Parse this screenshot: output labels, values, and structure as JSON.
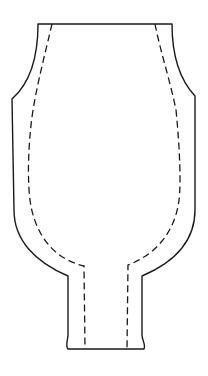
{
  "diagram": {
    "type": "pattern-outline",
    "colors": {
      "background": "#ffffff",
      "stroke": "#1a1a1a"
    },
    "outline": {
      "style": "solid",
      "path": "M38,24 L172,24 C172,55 180,80 195,96 L195,210 C195,240 175,262 142,276 L142,335 C142,340 146,345 144,349 L68,349 C65,345 68,340 68,335 L68,276 C35,262 14,240 14,210 L12,99 C28,85 38,60 38,24 Z"
    },
    "seam_line": {
      "style": "dashed",
      "left_path": "M52,24 C46,50 38,80 33,110 C27,150 28,185 30,200 C34,230 50,258 84,266 L85,349",
      "right_path": "M155,24 C160,50 170,80 176,110 C180,150 181,185 179,200 C176,225 162,252 128,265 L127,349"
    }
  }
}
